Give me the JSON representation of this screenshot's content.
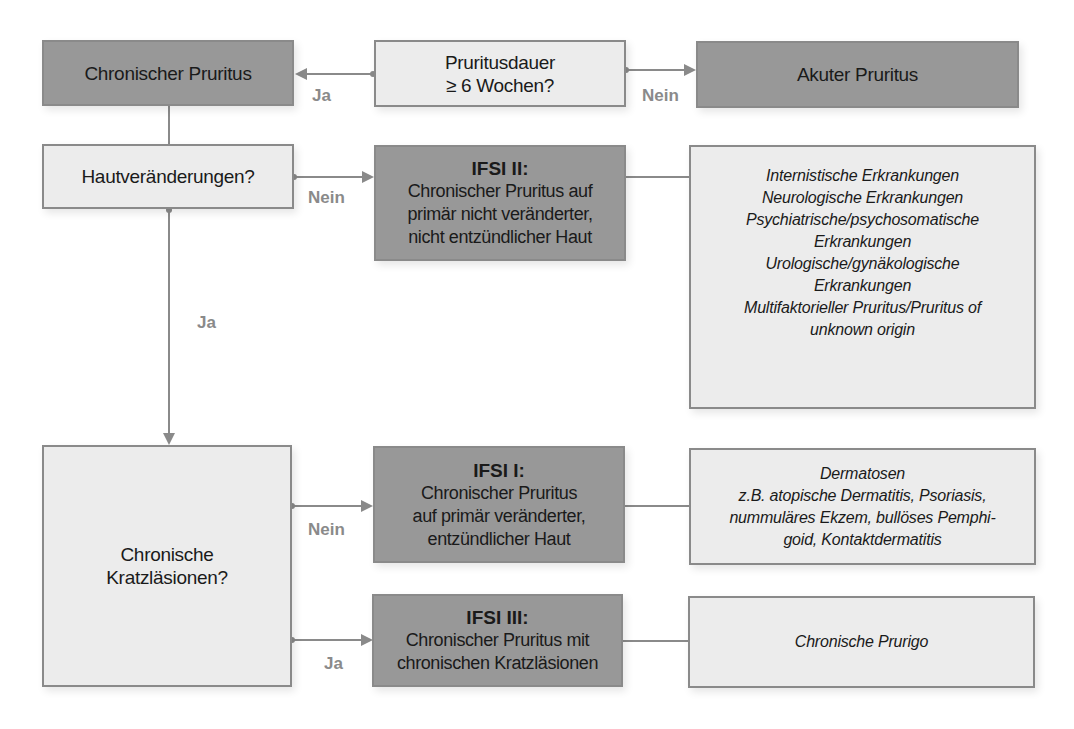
{
  "nodes": {
    "chronic": {
      "label": "Chronischer Pruritus"
    },
    "duration": {
      "lines": [
        "Pruritusdauer",
        "≥ 6 Wochen?"
      ]
    },
    "acute": {
      "label": "Akuter Pruritus"
    },
    "skin_changes": {
      "label": "Hautveränderungen?"
    },
    "ifsi2": {
      "title": "IFSI II:",
      "lines": [
        "Chronischer Pruritus auf",
        "primär nicht veränderter,",
        "nicht entzündlicher Haut"
      ]
    },
    "ifsi2_causes": {
      "lines": [
        "Internistische Erkrankungen",
        "Neurologische Erkrankungen",
        "Psychiatrische/psychosomatische",
        "Erkrankungen",
        "Urologische/gynäkologische",
        "Erkrankungen",
        "Multifaktorieller Pruritus/Pruritus of",
        "unknown origin"
      ]
    },
    "scratch_lesions": {
      "lines": [
        "Chronische",
        "Kratzläsionen?"
      ]
    },
    "ifsi1": {
      "title": "IFSI I:",
      "lines": [
        "Chronischer Pruritus",
        "auf primär veränderter,",
        "entzündlicher Haut"
      ]
    },
    "ifsi1_causes": {
      "lines": [
        "Dermatosen",
        "z.B. atopische Dermatitis, Psoriasis,",
        "nummuläres Ekzem, bullöses Pemphi-",
        "goid, Kontaktdermatitis"
      ]
    },
    "ifsi3": {
      "title": "IFSI III:",
      "lines": [
        "Chronischer Pruritus mit",
        "chronischen Kratzläsionen"
      ]
    },
    "ifsi3_causes": {
      "label": "Chronische Prurigo"
    }
  },
  "edges": {
    "duration_to_chronic": "Ja",
    "duration_to_acute": "Nein",
    "skin_to_ifsi2": "Nein",
    "skin_to_scratch": "Ja",
    "scratch_to_ifsi1": "Nein",
    "scratch_to_ifsi3": "Ja"
  },
  "colors": {
    "dark_box": "#989898",
    "light_box": "#ececec",
    "connector": "#8a8a8a"
  }
}
